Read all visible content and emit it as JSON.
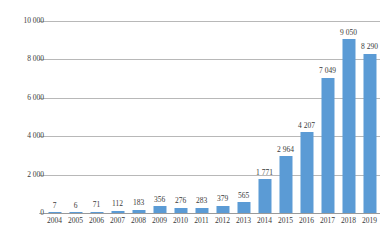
{
  "chart_data": {
    "type": "bar",
    "title": "",
    "subtitle": "",
    "xlabel": "",
    "ylabel": "",
    "categories": [
      "2004",
      "2005",
      "2006",
      "2007",
      "2008",
      "2009",
      "2010",
      "2011",
      "2012",
      "2013",
      "2014",
      "2015",
      "2016",
      "2017",
      "2018",
      "2019"
    ],
    "values": [
      7,
      6,
      71,
      112,
      183,
      356,
      276,
      283,
      379,
      565,
      1771,
      2964,
      4207,
      7049,
      9050,
      8290
    ],
    "value_labels": [
      "7",
      "6",
      "71",
      "112",
      "183",
      "356",
      "276",
      "283",
      "379",
      "565",
      "1 771",
      "2 964",
      "4 207",
      "7 049",
      "9 050",
      "8 290"
    ],
    "ylim": [
      0,
      10000
    ],
    "ytick_values": [
      0,
      2000,
      4000,
      6000,
      8000,
      10000
    ],
    "ytick_labels": [
      "0",
      "2 000",
      "4 000",
      "6 000",
      "8 000",
      "10 000"
    ],
    "grid": true,
    "legend": "none",
    "series": [
      {
        "name": "",
        "values": [
          7,
          6,
          71,
          112,
          183,
          356,
          276,
          283,
          379,
          565,
          1771,
          2964,
          4207,
          7049,
          9050,
          8290
        ]
      }
    ],
    "colors": {
      "bar": "#5b9bd5",
      "gridline": "#b8b8b8",
      "axis": "#9a9a9a",
      "text": "#3a3a3a",
      "background": "#ffffff"
    }
  }
}
